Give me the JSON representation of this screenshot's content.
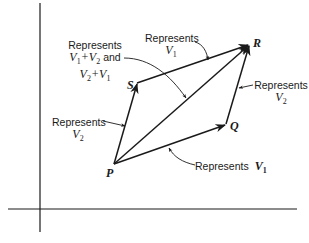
{
  "diagram": {
    "type": "vector-parallelogram",
    "points": {
      "P": {
        "label": "P",
        "x": 114,
        "y": 164
      },
      "Q": {
        "label": "Q",
        "x": 226,
        "y": 124
      },
      "R": {
        "label": "R",
        "x": 249,
        "y": 45
      },
      "S": {
        "label": "S",
        "x": 137,
        "y": 83
      }
    },
    "axes": {
      "vertical": {
        "x": 40,
        "y1": 3,
        "y2": 232
      },
      "horizontal": {
        "y": 209,
        "x1": 8,
        "x2": 297
      }
    },
    "annotations": {
      "sum": {
        "word": "Represents",
        "line2": "V1+V2 and",
        "line3": "V2+V1"
      },
      "top_v1": {
        "word": "Represents",
        "line2": "V1"
      },
      "right_v2": {
        "word": "Represents",
        "line2": "V2"
      },
      "left_v2": {
        "word": "Represents",
        "line2": "V2"
      },
      "bottom_v1": {
        "word": "Represents",
        "line2": "V1"
      }
    },
    "colors": {
      "ink": "#1a1a1a",
      "background": "#ffffff"
    }
  }
}
